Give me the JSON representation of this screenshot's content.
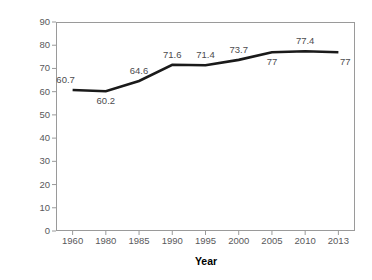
{
  "chart_data": {
    "type": "line",
    "title": "",
    "xlabel": "Year",
    "ylabel": "Female to Male Earnings Ratio (%)",
    "categories": [
      "1960",
      "1980",
      "1985",
      "1990",
      "1995",
      "2000",
      "2005",
      "2010",
      "2013"
    ],
    "values": [
      60.7,
      60.2,
      64.6,
      71.6,
      71.4,
      73.7,
      77,
      77.4,
      77
    ],
    "point_labels": [
      "60.7",
      "60.2",
      "64.6",
      "71.6",
      "71.4",
      "73.7",
      "77",
      "77.4",
      "77"
    ],
    "point_label_positions": [
      "above",
      "below",
      "above",
      "above",
      "above",
      "above",
      "below",
      "above",
      "below"
    ],
    "ylim": [
      0,
      90
    ],
    "y_tick_step": 10,
    "y_ticks": [
      "90",
      "80",
      "70",
      "60",
      "50",
      "40",
      "30",
      "20",
      "10",
      "0"
    ],
    "grid": false,
    "legend": "none",
    "series_color": "#1a1a1a",
    "axis_color": "#9a9a9a",
    "tick_label_color": "#59595b",
    "data_label_color": "#4c4c4e",
    "background_color": "#ffffff"
  }
}
